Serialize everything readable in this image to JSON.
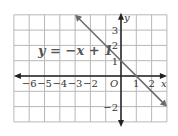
{
  "chart_data": {
    "type": "line",
    "title": "",
    "equation_label": "y = −x + 1",
    "xlabel": "x",
    "ylabel": "y",
    "origin_label": "O",
    "xlim": [
      -7,
      3
    ],
    "ylim": [
      -3,
      4
    ],
    "grid": true,
    "x_tick_labels": [
      "−6",
      "−5",
      "−4",
      "−3",
      "−2",
      "1",
      "2"
    ],
    "x_tick_values": [
      -6,
      -5,
      -4,
      -3,
      -2,
      1,
      2
    ],
    "y_tick_labels": [
      "3",
      "2",
      "1",
      "−2"
    ],
    "y_tick_values": [
      3,
      2,
      1,
      -2
    ],
    "series": [
      {
        "name": "y = −x + 1",
        "slope": -1,
        "intercept": 1,
        "x": [
          -3,
          3
        ],
        "y": [
          4,
          -2
        ]
      }
    ],
    "colors": {
      "line": "#6b6b6b",
      "grid": "#b8b8b8",
      "axis": "#222222",
      "text": "#333333"
    }
  }
}
